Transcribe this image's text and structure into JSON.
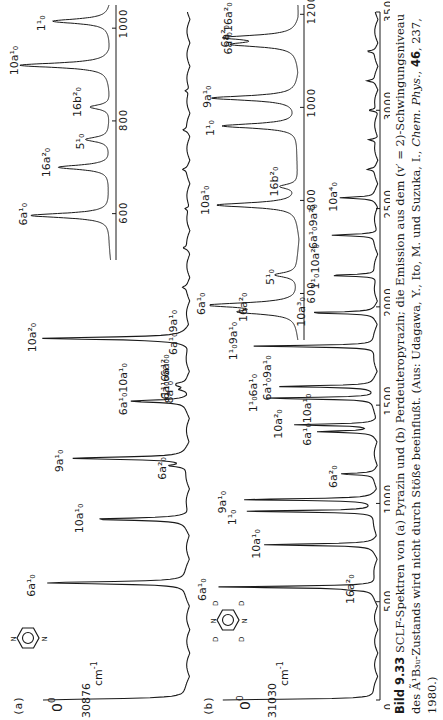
{
  "chart_data": [
    {
      "type": "line",
      "panel": "(a)",
      "molecule": "Pyrazin",
      "origin_label": "0⁰",
      "origin_value": "30876",
      "origin_unit": "cm⁻¹",
      "xlabel": "cm⁻¹ (shift from origin)",
      "xlim": [
        0,
        3500
      ],
      "x_ticks": [
        0,
        500,
        1000,
        1500,
        2000,
        2500,
        3000,
        3500
      ],
      "x_tick_labels": [
        "0",
        "500",
        "1000",
        "1500",
        "2000",
        "2500",
        "3000",
        "3500cm⁻¹"
      ],
      "peaks": [
        {
          "label": "0⁰",
          "x": 0,
          "height": 0.98
        },
        {
          "label": "6a¹₀",
          "x": 596,
          "height": 0.97
        },
        {
          "label": "10a¹₀",
          "x": 920,
          "height": 0.62
        },
        {
          "label": "6a²₀",
          "x": 1192,
          "height": 0.12
        },
        {
          "label": "9a¹₀",
          "x": 1230,
          "height": 0.78
        },
        {
          "label": "6a¹₀6a²₀",
          "x": 1600,
          "height": 0.05
        },
        {
          "label": "6a¹₀10a¹₀",
          "x": 1520,
          "height": 0.38
        },
        {
          "label": "8a¹₀",
          "x": 1580,
          "height": 0.05
        },
        {
          "label": "1¹₀6a¹₀",
          "x": 1610,
          "height": 0.05
        },
        {
          "label": "6a¹₀9a¹₀",
          "x": 1826,
          "height": 0.05
        },
        {
          "label": "10a²₀",
          "x": 1840,
          "height": 0.96
        }
      ],
      "inset": {
        "xlim": [
          500,
          1050
        ],
        "x_ticks": [
          600,
          800,
          1000
        ],
        "peaks": [
          {
            "label": "6a¹₀",
            "x": 596,
            "height": 0.85
          },
          {
            "label": "16a²₀",
            "x": 700,
            "height": 0.55
          },
          {
            "label": "5¹₀",
            "x": 760,
            "height": 0.25
          },
          {
            "label": "16b²₀",
            "x": 830,
            "height": 0.22
          },
          {
            "label": "10a¹₀",
            "x": 920,
            "height": 0.95
          },
          {
            "label": "1¹₀",
            "x": 1015,
            "height": 0.6
          }
        ]
      }
    },
    {
      "type": "line",
      "panel": "(b)",
      "molecule": "Perdeuteropyrazin",
      "origin_label": "0⁰",
      "origin_value": "31030",
      "origin_unit": "cm⁻¹",
      "xlabel": "cm⁻¹ (shift from origin)",
      "xlim": [
        0,
        3500
      ],
      "x_ticks": [
        0,
        500,
        1000,
        1500,
        2000,
        2500,
        3000,
        3500
      ],
      "peaks": [
        {
          "label": "0⁰",
          "x": 0,
          "height": 0.97
        },
        {
          "label": "16a²₀",
          "x": 560,
          "height": 0.08
        },
        {
          "label": "6a¹₀",
          "x": 575,
          "height": 0.99
        },
        {
          "label": "10a¹₀",
          "x": 790,
          "height": 0.7
        },
        {
          "label": "1¹₀",
          "x": 960,
          "height": 0.82
        },
        {
          "label": "9a¹₀",
          "x": 1020,
          "height": 0.85
        },
        {
          "label": "6a²₀",
          "x": 1150,
          "height": 0.22
        },
        {
          "label": "6a¹₀10a¹₀",
          "x": 1365,
          "height": 0.35
        },
        {
          "label": "10a²₀",
          "x": 1400,
          "height": 0.5
        },
        {
          "label": "1¹₀6a¹₀",
          "x": 1535,
          "height": 0.72
        },
        {
          "label": "6a¹₀9a¹₀",
          "x": 1595,
          "height": 0.6
        },
        {
          "label": "1¹₀9a¹₀",
          "x": 1800,
          "height": 0.78
        },
        {
          "label": "10a³₀",
          "x": 1970,
          "height": 0.42
        },
        {
          "label": "1¹₀10a²₀",
          "x": 2160,
          "height": 0.3
        },
        {
          "label": "6a¹₀9a²₀",
          "x": 2365,
          "height": 0.28
        },
        {
          "label": "10a⁴₀",
          "x": 2555,
          "height": 0.22
        }
      ],
      "inset": {
        "xlim": [
          500,
          1220
        ],
        "x_ticks": [
          600,
          800,
          1000,
          1200
        ],
        "peaks": [
          {
            "label": "16a²₀",
            "x": 560,
            "height": 0.55
          },
          {
            "label": "6a¹₀",
            "x": 575,
            "height": 0.95
          },
          {
            "label": "5¹₀",
            "x": 640,
            "height": 0.25
          },
          {
            "label": "10a¹₀",
            "x": 790,
            "height": 0.9
          },
          {
            "label": "16b²₀",
            "x": 830,
            "height": 0.2
          },
          {
            "label": "1¹₀",
            "x": 960,
            "height": 0.85
          },
          {
            "label": "9a¹₀",
            "x": 1020,
            "height": 0.95
          },
          {
            "label": "6a¹₀16a²₀",
            "x": 1135,
            "height": 0.65
          },
          {
            "label": "6a²₀",
            "x": 1150,
            "height": 0.75
          }
        ]
      }
    }
  ],
  "figure": {
    "panel_a_id": "(a)",
    "panel_b_id": "(b)",
    "origin_symbol": "0",
    "origin_sup": "0",
    "panel_a_origin_value": "30876",
    "panel_b_origin_value": "31030",
    "unit": "cm",
    "unit_sup": "-1",
    "main_ticks": [
      "0",
      "500",
      "1000",
      "1500",
      "2000",
      "2500",
      "3000",
      "3500cm"
    ],
    "main_last_sup": "-1",
    "inset_a_ticks": [
      "600",
      "800",
      "1000"
    ],
    "inset_b_ticks": [
      "600",
      "800",
      "1000",
      "1200"
    ]
  },
  "caption": {
    "number": "Bild 9.33",
    "text": " SCLF-Spektren von (a) Pyrazin und (b) Perdeuteropyrazin; die Emission aus dem (v′ = 2)-Schwingungsniveau des Ã¹B₃ᵤ-Zustands wird nicht durch Stöße beeinflußt. (Aus: Udagawa, Y., Ito, M. und Suzuka, I., ",
    "journal": "Chem. Phys.",
    "volume": "46",
    "rest": ", 237, 1980.)"
  }
}
